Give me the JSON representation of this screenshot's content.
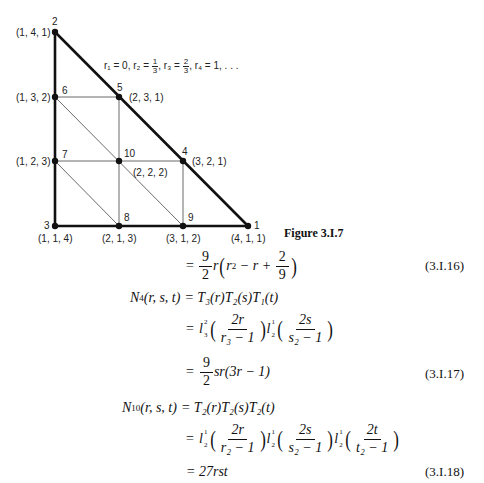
{
  "figure": {
    "caption": "Figure 3.I.7",
    "parameters": {
      "r1": "r₁ = 0,",
      "r2_prefix": "r₂ =",
      "r2_num": "1",
      "r2_den": "3",
      "r3_prefix": ", r₃ =",
      "r3_num": "2",
      "r3_den": "3",
      "r4": ", r₄ = 1, . . ."
    },
    "nodes": [
      {
        "id": "1",
        "coord": "(4, 1, 1)",
        "x": 248,
        "y": 226
      },
      {
        "id": "2",
        "coord": "(1, 4, 1)",
        "x": 55,
        "y": 32
      },
      {
        "id": "3",
        "coord": "(1, 1, 4)",
        "x": 55,
        "y": 226
      },
      {
        "id": "4",
        "coord": "(3, 2, 1)",
        "x": 183,
        "y": 161
      },
      {
        "id": "5",
        "coord": "(2, 3, 1)",
        "x": 119,
        "y": 97
      },
      {
        "id": "6",
        "coord": "(1, 3, 2)",
        "x": 55,
        "y": 97
      },
      {
        "id": "7",
        "coord": "(1, 2, 3)",
        "x": 55,
        "y": 161
      },
      {
        "id": "8",
        "coord": "(2, 1, 3)",
        "x": 119,
        "y": 226
      },
      {
        "id": "9",
        "coord": "(3, 1, 2)",
        "x": 183,
        "y": 226
      },
      {
        "id": "10",
        "coord": "(2, 2, 2)",
        "x": 119,
        "y": 161
      }
    ]
  },
  "equations": {
    "eq16": {
      "eq": "=",
      "coef_num": "9",
      "coef_den": "2",
      "body_pre": "r",
      "inner": "r",
      "inner_sup": "2",
      "inner_mid": " − r + ",
      "frac_num": "2",
      "frac_den": "9",
      "number": "(3.I.16)"
    },
    "eq17": {
      "lhs_N": "N",
      "lhs_sub": "4",
      "lhs_args": "(r, s, t)",
      "line1": "= T₃(r)T₂(s)T₁(t)",
      "line2_eq": "=",
      "l1_sup": "2",
      "l1_sub": "3",
      "f1_num": "2r",
      "f1_den": "r₃ − 1",
      "l2_sup": "1",
      "l2_sub": "2",
      "f2_num": "2s",
      "f2_den": "s₂ − 1",
      "line3_eq": "=",
      "line3_coef_num": "9",
      "line3_coef_den": "2",
      "line3_rest": "sr(3r − 1)",
      "number": "(3.I.17)"
    },
    "eq18": {
      "lhs_N": "N",
      "lhs_sub": "10",
      "lhs_args": "(r, s, t)",
      "line1": "= T₂(r)T₂(s)T₂(t)",
      "line2_eq": "=",
      "l_sup": "1",
      "l_sub": "2",
      "f1_num": "2r",
      "f1_den": "r₂ − 1",
      "f2_num": "2s",
      "f2_den": "s₂ − 1",
      "f3_num": "2t",
      "f3_den": "t₂ − 1",
      "line3": "= 27rst",
      "number": "(3.I.18)"
    }
  }
}
